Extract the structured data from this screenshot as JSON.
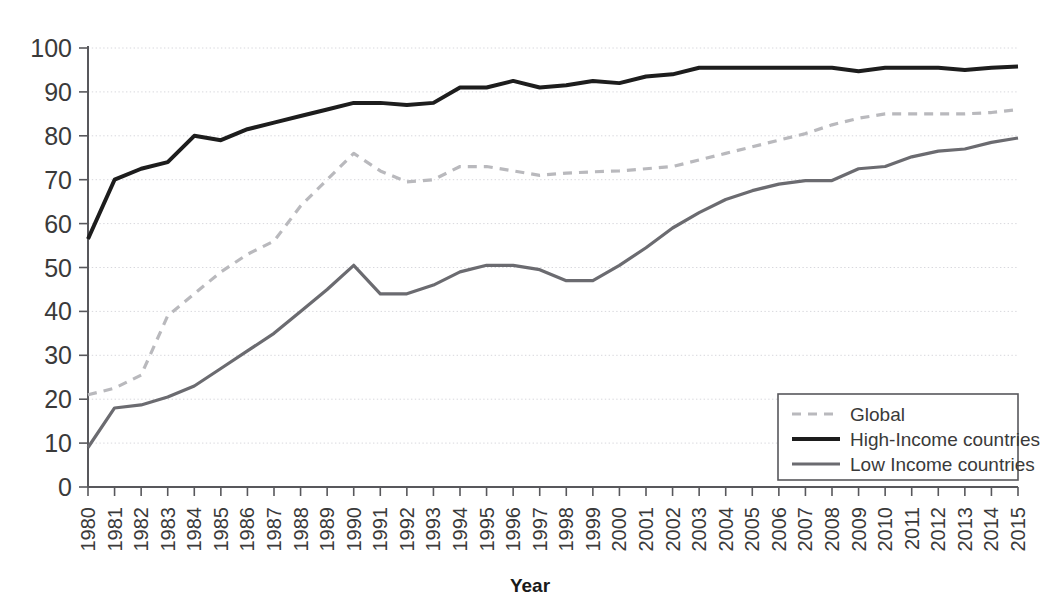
{
  "chart_data": {
    "type": "line",
    "title": "",
    "subtitle": "",
    "xlabel": "Year",
    "ylabel": "",
    "grid": true,
    "legend_position": "bottom-right",
    "xlim": [
      1980,
      2015
    ],
    "ylim": [
      0,
      100
    ],
    "yticks": [
      0,
      10,
      20,
      30,
      40,
      50,
      60,
      70,
      80,
      90,
      100
    ],
    "categories": [
      "1980",
      "1981",
      "1982",
      "1983",
      "1984",
      "1985",
      "1986",
      "1987",
      "1988",
      "1989",
      "1990",
      "1991",
      "1992",
      "1993",
      "1994",
      "1995",
      "1996",
      "1997",
      "1998",
      "1999",
      "2000",
      "2001",
      "2002",
      "2003",
      "2004",
      "2005",
      "2006",
      "2007",
      "2008",
      "2009",
      "2010",
      "2011",
      "2012",
      "2013",
      "2014",
      "2015"
    ],
    "series": [
      {
        "name": "Global",
        "style": "dashed",
        "color": "#b9b9bd",
        "values": [
          21,
          22.5,
          25.5,
          39,
          44,
          49,
          53,
          56,
          64,
          70,
          76,
          72,
          69.5,
          70,
          73,
          73,
          72,
          71,
          71.5,
          71.8,
          72,
          72.5,
          73,
          74.5,
          76,
          77.5,
          79,
          80.5,
          82.5,
          84,
          85,
          85,
          85,
          85,
          85.3,
          86
        ]
      },
      {
        "name": "High-Income countries",
        "style": "solid",
        "color": "#1d1d1d",
        "values": [
          56.5,
          70,
          72.5,
          74,
          80,
          79,
          81.5,
          83,
          84.5,
          86,
          87.5,
          87.5,
          87,
          87.5,
          91,
          91,
          92.5,
          91,
          91.5,
          92.5,
          92,
          93.5,
          94,
          95.5,
          95.5,
          95.5,
          95.5,
          95.5,
          95.5,
          94.7,
          95.5,
          95.5,
          95.5,
          95,
          95.5,
          95.8
        ]
      },
      {
        "name": "Low Income countries",
        "style": "solid",
        "color": "#6b6b70",
        "values": [
          9,
          18,
          18.7,
          20.5,
          23,
          27,
          31,
          35,
          40,
          45,
          50.5,
          44,
          44,
          46,
          49,
          50.5,
          50.5,
          49.5,
          47,
          47,
          50.5,
          54.5,
          59,
          62.5,
          65.5,
          67.5,
          69,
          69.8,
          69.8,
          72.5,
          73,
          75.2,
          76.5,
          77,
          78.5,
          79.5
        ]
      }
    ]
  },
  "legend": {
    "items": [
      {
        "label": "Global"
      },
      {
        "label": "High-Income countries"
      },
      {
        "label": "Low Income countries"
      }
    ]
  },
  "axes": {
    "x_title": "Year"
  }
}
